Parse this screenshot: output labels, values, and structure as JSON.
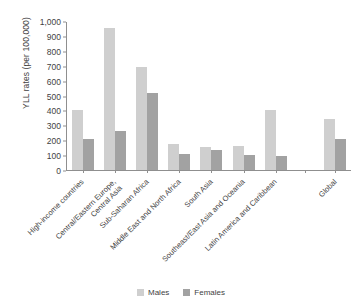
{
  "figure": {
    "top_caption": "",
    "legend": [
      {
        "label": "Males",
        "color": "#cfcfcf",
        "key": "males"
      },
      {
        "label": "Females",
        "color": "#a2a2a2",
        "key": "females"
      }
    ]
  },
  "chart_data": {
    "type": "bar",
    "title": "",
    "xlabel": "",
    "ylabel": "YLL rates (per 100,000)",
    "ylim": [
      0,
      1000
    ],
    "yticks": [
      0,
      100,
      200,
      300,
      400,
      500,
      600,
      700,
      800,
      900,
      1000
    ],
    "ytick_labels": [
      "0",
      "100",
      "200",
      "300",
      "400",
      "500",
      "600",
      "700",
      "800",
      "900",
      "1,000"
    ],
    "grid": false,
    "legend_position": "bottom-center",
    "categories": [
      "High-income countries",
      "Central/Eastern Europe, Central Asia",
      "Sub-Saharan Africa",
      "Middle East and North Africa",
      "South Asia",
      "Southeast/East Asia and Oceania",
      "Latin America and Caribbean",
      "",
      "Global"
    ],
    "category_lines": [
      [
        "High-income countries"
      ],
      [
        "Central/Eastern Europe,",
        "Central Asia"
      ],
      [
        "Sub-Saharan Africa"
      ],
      [
        "Middle East and North Africa"
      ],
      [
        "South Asia"
      ],
      [
        "Southeast/East Asia and Oceania"
      ],
      [
        "Latin America and Caribbean"
      ],
      [
        ""
      ],
      [
        "Global"
      ]
    ],
    "series": [
      {
        "name": "Males",
        "color": "#cfcfcf",
        "values": [
          400,
          950,
          690,
          175,
          155,
          162,
          400,
          null,
          345
        ]
      },
      {
        "name": "Females",
        "color": "#a2a2a2",
        "values": [
          210,
          265,
          520,
          105,
          132,
          100,
          97,
          null,
          210
        ]
      }
    ]
  }
}
